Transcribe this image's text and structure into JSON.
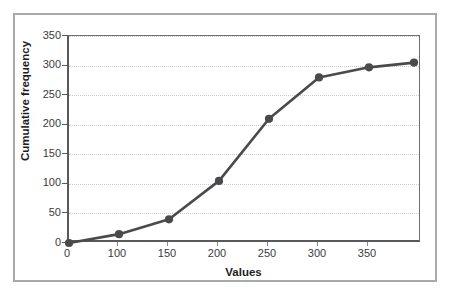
{
  "chart_data": {
    "type": "line",
    "title": "",
    "subtitle": "",
    "xlabel": "Values",
    "ylabel": "Cumulative frequency",
    "x_tick_labels": [
      "0",
      "100",
      "150",
      "200",
      "250",
      "300",
      "350"
    ],
    "y_tick_labels": [
      "0",
      "50",
      "100",
      "150",
      "200",
      "250",
      "300",
      "350"
    ],
    "ylim": [
      0,
      350
    ],
    "grid": "horizontal-dotted",
    "legend": "none",
    "x_axis_note": "categorical/unevenly-spaced tick positions",
    "categories": [
      "0",
      "100",
      "150",
      "200",
      "250",
      "300",
      "350",
      ""
    ],
    "series": [
      {
        "name": "Cumulative frequency",
        "marker": "circle",
        "color": "#4a4a4c",
        "x": [
          0,
          100,
          150,
          200,
          250,
          300,
          350,
          395
        ],
        "values": [
          0,
          15,
          40,
          105,
          210,
          280,
          297,
          305
        ]
      }
    ],
    "colors": {
      "line": "#4a4a4c",
      "marker": "#4a4a4c",
      "axis": "#59595b",
      "gridline": "#c9cfd6",
      "frame": "#a9a9a9",
      "background": "#ffffff",
      "tick_text": "#3b3b3d",
      "axis_title_text": "#1d1d1f"
    }
  }
}
